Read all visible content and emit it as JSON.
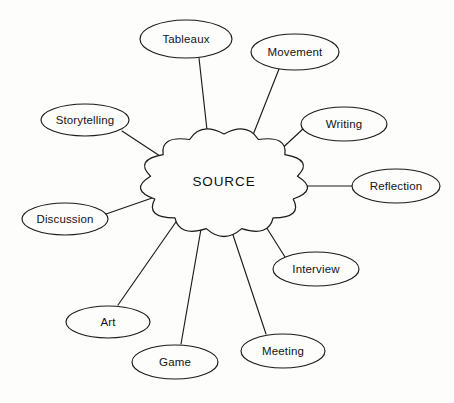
{
  "diagram": {
    "type": "mind-map",
    "title": "SOURCE",
    "background_color": "#fdfdfc",
    "stroke_color": "#1b1b1b",
    "center": {
      "label": "SOURCE",
      "shape": "cloud",
      "cx": 224,
      "cy": 182,
      "rx": 74,
      "ry": 48
    },
    "nodes": [
      {
        "id": "tableaux",
        "label": "Tableaux",
        "cx": 186,
        "cy": 39,
        "rx": 46,
        "ry": 19,
        "anchor_x": 199,
        "anchor_y": 58,
        "hub_x": 208,
        "hub_y": 139
      },
      {
        "id": "movement",
        "label": "Movement",
        "cx": 295,
        "cy": 52,
        "rx": 44,
        "ry": 18,
        "anchor_x": 279,
        "anchor_y": 69,
        "hub_x": 251,
        "hub_y": 140
      },
      {
        "id": "writing",
        "label": "Writing",
        "cx": 344,
        "cy": 124,
        "rx": 43,
        "ry": 17,
        "anchor_x": 304,
        "anchor_y": 128,
        "hub_x": 275,
        "hub_y": 155
      },
      {
        "id": "reflection",
        "label": "Reflection",
        "cx": 396,
        "cy": 186,
        "rx": 44,
        "ry": 17,
        "anchor_x": 353,
        "anchor_y": 186,
        "hub_x": 292,
        "hub_y": 186
      },
      {
        "id": "interview",
        "label": "Interview",
        "cx": 316,
        "cy": 269,
        "rx": 43,
        "ry": 17,
        "anchor_x": 285,
        "anchor_y": 257,
        "hub_x": 263,
        "hub_y": 222
      },
      {
        "id": "meeting",
        "label": "Meeting",
        "cx": 283,
        "cy": 351,
        "rx": 42,
        "ry": 17,
        "anchor_x": 266,
        "anchor_y": 334,
        "hub_x": 231,
        "hub_y": 229
      },
      {
        "id": "game",
        "label": "Game",
        "cx": 175,
        "cy": 362,
        "rx": 43,
        "ry": 17,
        "anchor_x": 181,
        "anchor_y": 344,
        "hub_x": 201,
        "hub_y": 229
      },
      {
        "id": "art",
        "label": "Art",
        "cx": 108,
        "cy": 322,
        "rx": 42,
        "ry": 16,
        "anchor_x": 118,
        "anchor_y": 305,
        "hub_x": 178,
        "hub_y": 219
      },
      {
        "id": "discussion",
        "label": "Discussion",
        "cx": 65,
        "cy": 219,
        "rx": 43,
        "ry": 16,
        "anchor_x": 106,
        "anchor_y": 214,
        "hub_x": 155,
        "hub_y": 197
      },
      {
        "id": "storytelling",
        "label": "Storytelling",
        "cx": 85,
        "cy": 120,
        "rx": 44,
        "ry": 16,
        "anchor_x": 122,
        "anchor_y": 131,
        "hub_x": 163,
        "hub_y": 158
      }
    ]
  }
}
